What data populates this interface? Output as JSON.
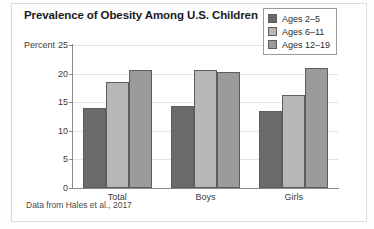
{
  "title": "Prevalence of Obesity Among U.S. Children",
  "axis": {
    "ylabel": "Percent",
    "yticks": [
      "25",
      "20",
      "15",
      "10",
      "5",
      "0"
    ]
  },
  "caption": "Data from Hales et al., 2017",
  "legend": {
    "items": [
      {
        "label": "Ages 2–5",
        "color": "#6b6b6b"
      },
      {
        "label": "Ages 6–11",
        "color": "#b7b7b7"
      },
      {
        "label": "Ages 12–19",
        "color": "#9b9b9b"
      }
    ]
  },
  "chart_data": {
    "type": "bar",
    "title": "Prevalence of Obesity Among U.S. Children",
    "xlabel": "",
    "ylabel": "Percent",
    "ylim": [
      0,
      25
    ],
    "ytick_step": 5,
    "grid": true,
    "legend_position": "top-right",
    "categories": [
      "Total",
      "Boys",
      "Girls"
    ],
    "series": [
      {
        "name": "Ages 2–5",
        "color": "#6b6b6b",
        "values": [
          14.0,
          14.3,
          13.5
        ]
      },
      {
        "name": "Ages 6–11",
        "color": "#b7b7b7",
        "values": [
          18.5,
          20.6,
          16.3
        ]
      },
      {
        "name": "Ages 12–19",
        "color": "#9b9b9b",
        "values": [
          20.6,
          20.2,
          20.9
        ]
      }
    ],
    "annotations": [
      "Data from Hales et al., 2017"
    ]
  }
}
